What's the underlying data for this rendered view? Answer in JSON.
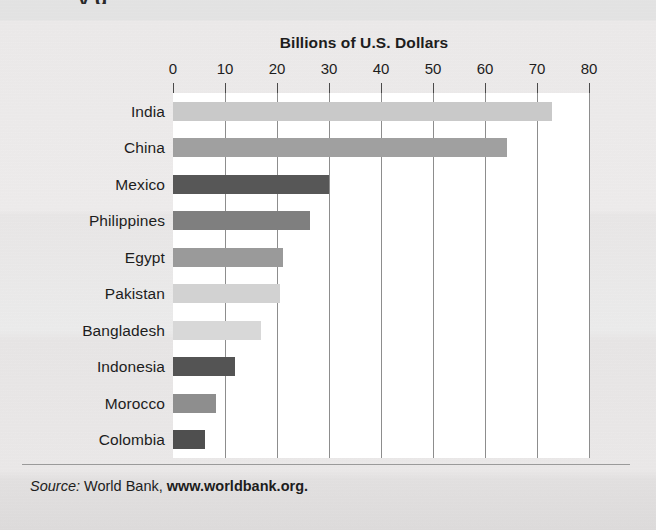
{
  "page": {
    "cutoff_heading": "y g",
    "background_color": "#e9e9e9"
  },
  "figure": {
    "chart_title": "Billions of U.S. Dollars",
    "source_prefix": "Source:",
    "source_org": "World Bank,",
    "source_url": "www.worldbank.org."
  },
  "chart_data": {
    "type": "bar",
    "orientation": "horizontal",
    "title": "Billions of U.S. Dollars",
    "xlabel": "Billions of U.S. Dollars",
    "ylabel": "",
    "xlim": [
      0,
      80
    ],
    "ylim": null,
    "grid": true,
    "legend": null,
    "xticks": [
      0,
      10,
      20,
      30,
      40,
      50,
      60,
      70,
      80
    ],
    "xtick_labels": [
      "0",
      "10",
      "20",
      "30",
      "40",
      "50",
      "60",
      "70",
      "80"
    ],
    "categories": [
      "India",
      "China",
      "Mexico",
      "Philippines",
      "Egypt",
      "Pakistan",
      "Bangladesh",
      "Indonesia",
      "Morocco",
      "Colombia"
    ],
    "values": [
      72.8,
      64.3,
      30.0,
      26.4,
      21.2,
      20.5,
      17.0,
      12.0,
      8.2,
      6.2
    ],
    "bar_colors": [
      "#c9c9c9",
      "#a0a0a0",
      "#575757",
      "#7f7f7f",
      "#9a9a9a",
      "#d2d2d2",
      "#d8d8d8",
      "#545454",
      "#8e8e8e",
      "#4f4f4f"
    ],
    "plot_background": "#ffffff",
    "gridline_color": "#8d8d8d"
  }
}
